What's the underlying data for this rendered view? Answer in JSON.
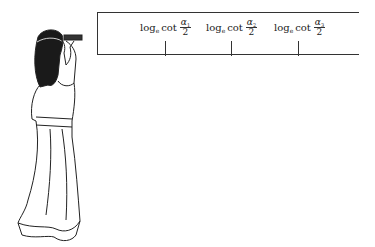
{
  "board": {
    "labels": [
      {
        "log": "log",
        "base": "e",
        "fn": "cot",
        "num": "α",
        "num_sub": "1",
        "den": "2"
      },
      {
        "log": "log",
        "base": "e",
        "fn": "cot",
        "num": "α",
        "num_sub": "2",
        "den": "2"
      },
      {
        "log": "log",
        "base": "e",
        "fn": "cot",
        "num": "α",
        "num_sub": "3",
        "den": "2"
      }
    ],
    "tick_positions_px": [
      164,
      230,
      297
    ]
  }
}
